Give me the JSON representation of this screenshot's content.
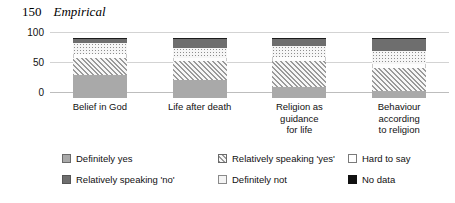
{
  "runhead": {
    "folio": "150",
    "title": "Empirical"
  },
  "axis": {
    "ticks": [
      "100",
      "50",
      "0"
    ],
    "max": 100,
    "min": 0
  },
  "legend": {
    "items": [
      {
        "label": "Definitely yes",
        "key": "definitely_yes"
      },
      {
        "label": "Relatively speaking 'yes'",
        "key": "relatively_yes"
      },
      {
        "label": "Hard to say",
        "key": "hard_to_say"
      },
      {
        "label": "Relatively speaking 'no'",
        "key": "relatively_no"
      },
      {
        "label": "Definitely not",
        "key": "definitely_not"
      },
      {
        "label": "No data",
        "key": "no_data"
      }
    ]
  },
  "categories": [
    {
      "lines": [
        "Belief in God"
      ]
    },
    {
      "lines": [
        "Life after death"
      ]
    },
    {
      "lines": [
        "Religion as",
        "guidance",
        "for life"
      ]
    },
    {
      "lines": [
        "Behaviour",
        "according",
        "to religion"
      ]
    }
  ],
  "chart_data": {
    "type": "bar",
    "subtype": "stacked-percentage",
    "title": "",
    "xlabel": "",
    "ylabel": "",
    "ylim": [
      0,
      100
    ],
    "yticks": [
      0,
      50,
      100
    ],
    "grid": true,
    "legend_position": "bottom",
    "categories": [
      "Belief in God",
      "Life after death",
      "Religion as guidance for life",
      "Behaviour according to religion"
    ],
    "series": [
      {
        "name": "Definitely yes",
        "values": [
          38,
          30,
          18,
          12
        ]
      },
      {
        "name": "Relatively speaking 'yes'",
        "values": [
          29,
          31,
          44,
          38
        ]
      },
      {
        "name": "Hard to say",
        "values": [
          6,
          6,
          7,
          7
        ]
      },
      {
        "name": "Relatively speaking 'no'",
        "values": [
          19,
          17,
          18,
          22
        ]
      },
      {
        "name": "Definitely not",
        "values": [
          6,
          14,
          11,
          19
        ]
      },
      {
        "name": "No data",
        "values": [
          2,
          2,
          2,
          2
        ]
      }
    ]
  }
}
